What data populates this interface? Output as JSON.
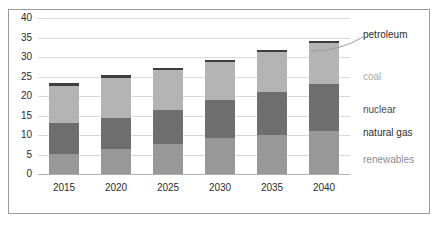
{
  "chart_data": {
    "type": "bar",
    "stacked": true,
    "title": "",
    "xlabel": "",
    "ylabel": "",
    "categories": [
      "2015",
      "2020",
      "2025",
      "2030",
      "2035",
      "2040"
    ],
    "ylim": [
      0,
      40
    ],
    "yticks": [
      0,
      5,
      10,
      15,
      20,
      25,
      30,
      35,
      40
    ],
    "ytick_labels": [
      "0",
      "5",
      "10",
      "15",
      "20",
      "25",
      "30",
      "35",
      "40"
    ],
    "grid": true,
    "legend_position": "right",
    "series": [
      {
        "name": "renewables",
        "color": "#989898",
        "values": [
          5.1,
          6.5,
          7.7,
          9.2,
          10.1,
          10.9
        ]
      },
      {
        "name": "natural gas",
        "color": "#6e6e6e",
        "values": [
          7.9,
          7.9,
          8.7,
          9.7,
          11.0,
          12.3
        ]
      },
      {
        "name": "nuclear",
        "color": "#c3c3c3",
        "values": [
          0.0,
          0.0,
          0.0,
          0.0,
          0.0,
          0.0
        ]
      },
      {
        "name": "coal",
        "color": "#b4b4b4",
        "values": [
          9.6,
          10.3,
          10.2,
          9.9,
          10.1,
          10.4
        ]
      },
      {
        "name": "petroleum",
        "color": "#3d3d3d",
        "values": [
          0.7,
          0.6,
          0.5,
          0.5,
          0.5,
          0.5
        ]
      }
    ],
    "totals": [
      23.3,
      25.3,
      27.1,
      29.3,
      31.7,
      34.1
    ],
    "annotations": []
  },
  "legend": {
    "items": [
      {
        "label": "petroleum",
        "color": "#2b2b2b"
      },
      {
        "label": "coal",
        "color": "#a9a9a9"
      },
      {
        "label": "nuclear",
        "color": "#4a4a4a"
      },
      {
        "label": "natural gas",
        "color": "#2b2b2b"
      },
      {
        "label": "renewables",
        "color": "#8c8c8c"
      }
    ]
  }
}
